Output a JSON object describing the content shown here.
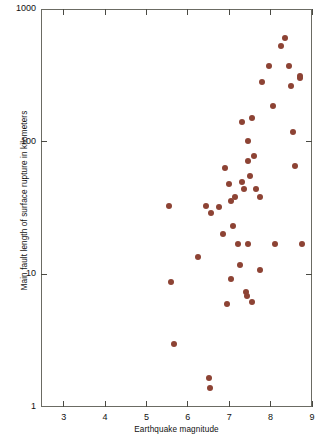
{
  "figure": {
    "background": "#ffffff",
    "frame_color": "#6b6b63",
    "marker_color": "#8d4334"
  },
  "chart_data": {
    "type": "scatter",
    "title": "",
    "xlabel": "Earthquake magnitude",
    "ylabel": "Main fault length of surface rupture in kilometers",
    "xscale": "linear",
    "yscale": "log",
    "xlim": [
      2.45,
      9.0
    ],
    "ylim": [
      1,
      1000
    ],
    "grid": false,
    "legend": null,
    "xticks": [
      3,
      4,
      5,
      6,
      7,
      8,
      9
    ],
    "xtick_labels": [
      "3",
      "4",
      "5",
      "6",
      "7",
      "8",
      "9"
    ],
    "yticks": [
      1,
      10,
      100,
      1000
    ],
    "ytick_labels": [
      "1",
      "10",
      "100",
      "1000"
    ],
    "marker": "circle",
    "marker_color": "#8d4334",
    "points": [
      {
        "x": 5.55,
        "y": 33
      },
      {
        "x": 5.6,
        "y": 8.8
      },
      {
        "x": 5.67,
        "y": 3.0
      },
      {
        "x": 6.25,
        "y": 13.5
      },
      {
        "x": 6.45,
        "y": 33
      },
      {
        "x": 6.52,
        "y": 1.65
      },
      {
        "x": 6.53,
        "y": 1.38
      },
      {
        "x": 6.55,
        "y": 29
      },
      {
        "x": 6.75,
        "y": 32
      },
      {
        "x": 6.85,
        "y": 20
      },
      {
        "x": 6.9,
        "y": 63
      },
      {
        "x": 6.95,
        "y": 6.0
      },
      {
        "x": 7.0,
        "y": 48
      },
      {
        "x": 7.05,
        "y": 36
      },
      {
        "x": 7.05,
        "y": 9.2
      },
      {
        "x": 7.1,
        "y": 23
      },
      {
        "x": 7.15,
        "y": 38
      },
      {
        "x": 7.2,
        "y": 17
      },
      {
        "x": 7.25,
        "y": 11.8
      },
      {
        "x": 7.3,
        "y": 50
      },
      {
        "x": 7.3,
        "y": 140
      },
      {
        "x": 7.35,
        "y": 44
      },
      {
        "x": 7.4,
        "y": 7.3
      },
      {
        "x": 7.42,
        "y": 6.9
      },
      {
        "x": 7.45,
        "y": 72
      },
      {
        "x": 7.45,
        "y": 17
      },
      {
        "x": 7.45,
        "y": 102
      },
      {
        "x": 7.5,
        "y": 55
      },
      {
        "x": 7.55,
        "y": 6.2
      },
      {
        "x": 7.55,
        "y": 150
      },
      {
        "x": 7.6,
        "y": 78
      },
      {
        "x": 7.65,
        "y": 44
      },
      {
        "x": 7.75,
        "y": 38
      },
      {
        "x": 7.75,
        "y": 10.8
      },
      {
        "x": 7.8,
        "y": 280
      },
      {
        "x": 7.95,
        "y": 370
      },
      {
        "x": 8.05,
        "y": 185
      },
      {
        "x": 8.1,
        "y": 17
      },
      {
        "x": 8.25,
        "y": 530
      },
      {
        "x": 8.35,
        "y": 600
      },
      {
        "x": 8.45,
        "y": 370
      },
      {
        "x": 8.5,
        "y": 265
      },
      {
        "x": 8.55,
        "y": 118
      },
      {
        "x": 8.6,
        "y": 65
      },
      {
        "x": 8.7,
        "y": 300
      },
      {
        "x": 8.72,
        "y": 310
      },
      {
        "x": 8.75,
        "y": 17
      }
    ]
  }
}
